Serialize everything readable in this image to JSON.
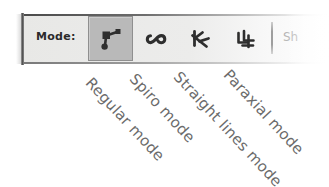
{
  "toolbar": {
    "mode_label": "Mode:",
    "faded_text": "Sh",
    "buttons": [
      {
        "name": "regular-mode",
        "label": "Regular mode",
        "icon": "bezier-node-icon",
        "selected": true
      },
      {
        "name": "spiro-mode",
        "label": "Spiro mode",
        "icon": "spiro-curve-icon",
        "selected": false
      },
      {
        "name": "straight-lines-mode",
        "label": "Straight lines mode",
        "icon": "zigzag-lines-icon",
        "selected": false
      },
      {
        "name": "paraxial-mode",
        "label": "Paraxial mode",
        "icon": "paraxial-right-angle-icon",
        "selected": false
      }
    ]
  },
  "callouts": [
    {
      "text": "Regular mode"
    },
    {
      "text": "Spiro mode"
    },
    {
      "text": "Straight lines mode"
    },
    {
      "text": "Paraxial mode"
    }
  ],
  "colors": {
    "toolbar_bg": "#ebebe9",
    "selected_bg": "#b9b9b9",
    "icon": "#2e2e2e",
    "callout_text": "#6b6b6b",
    "faded_text": "#b4b4b4"
  }
}
